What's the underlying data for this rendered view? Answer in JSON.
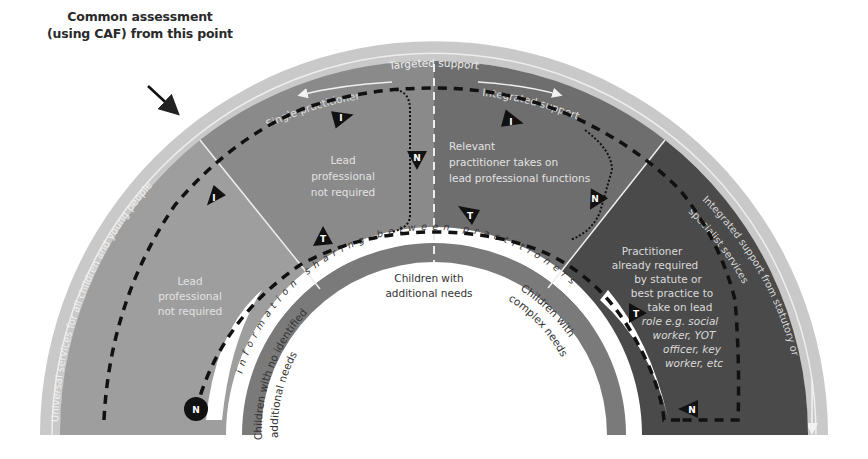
{
  "caption": {
    "line1": "Common assessment",
    "line2": "(using CAF) from this point"
  },
  "rim": {
    "left_text": "Universal services for all children and young people",
    "right_text_line1": "Integrated support from statutory or",
    "right_text_line2": "specialist services"
  },
  "top_band": {
    "targeted_support": "Targeted support",
    "single_practitioner": "Single practitioner",
    "integrated_support": "Integrated support"
  },
  "sectors": {
    "left": {
      "lines": [
        "Lead",
        "professional",
        "not required"
      ]
    },
    "middle_left": {
      "lines": [
        "Lead",
        "professional",
        "not required"
      ]
    },
    "middle_right": {
      "lines": [
        "Relevant",
        "practitioner takes on",
        "lead professional functions"
      ]
    },
    "right": {
      "lines": [
        "Practitioner",
        "already required",
        "by statute or",
        "best practice to",
        "take on lead",
        "role e.g. social",
        "worker, YOT",
        "officer, key",
        "worker, etc"
      ]
    }
  },
  "info_band": {
    "text": "information sharing between practitioners"
  },
  "inner_labels": {
    "no_needs_line1": "Children with no identified",
    "no_needs_line2": "additional needs",
    "additional_line1": "Children with",
    "additional_line2": "additional needs",
    "complex_line1": "Children with",
    "complex_line2": "complex needs"
  },
  "markers": {
    "identify": "I",
    "notify": "N",
    "transfer": "T"
  },
  "colors": {
    "rim": "#c9c9c9",
    "rim_line": "#ececec",
    "sector_left": "#9e9e9e",
    "sector_mid_left": "#8c8c8c",
    "sector_mid_right": "#6f6f6f",
    "sector_right": "#4a4a4a",
    "info_band": "#ffffff",
    "inner_band": "#7d7d7d",
    "text_light": "#e6e6e6",
    "path": "#111111"
  }
}
